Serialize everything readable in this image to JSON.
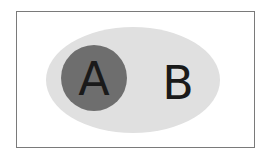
{
  "diagram": {
    "type": "venn-subset",
    "outer_set": {
      "label": "B",
      "fill": "#e0e0e0"
    },
    "inner_set": {
      "label": "A",
      "fill": "#6e6e6e"
    },
    "frame_border": "#7a7a7a",
    "relation": "A is a subset of B"
  }
}
